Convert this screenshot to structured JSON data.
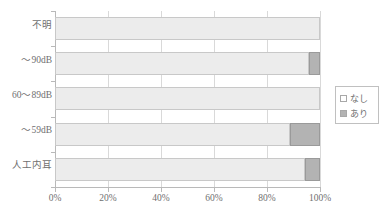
{
  "chart_data": {
    "type": "bar",
    "orientation": "horizontal",
    "stacked": true,
    "stack_mode": "percent",
    "title": "",
    "xlabel": "",
    "ylabel": "",
    "xlim": [
      0,
      100
    ],
    "xticks": [
      0,
      20,
      40,
      60,
      80,
      100
    ],
    "xtick_labels": [
      "0%",
      "20%",
      "40%",
      "60%",
      "80%",
      "100%"
    ],
    "grid": true,
    "grid_axis": "x",
    "legend_position": "right",
    "categories": [
      "人工内耳",
      "～59dB",
      "60～89dB",
      "～90dB",
      "不明"
    ],
    "categories_top_to_bottom": [
      "不明",
      "～90dB",
      "60～89dB",
      "～59dB",
      "人工内耳"
    ],
    "series": [
      {
        "name": "なし",
        "color": "#ececec",
        "values_top_to_bottom": [
          100,
          95.8,
          100,
          88.7,
          94.3
        ]
      },
      {
        "name": "あり",
        "color": "#b3b3b3",
        "values_top_to_bottom": [
          0,
          4.2,
          0,
          11.3,
          5.7
        ]
      }
    ]
  },
  "legend": {
    "items": [
      {
        "label": "なし",
        "swatch": "white-square-swatch"
      },
      {
        "label": "あり",
        "swatch": "gray-square-swatch"
      }
    ]
  },
  "axes": {
    "y_labels": [
      "不明",
      "～90dB",
      "60～89dB",
      "～59dB",
      "人工内耳"
    ],
    "x_labels": [
      "0%",
      "20%",
      "40%",
      "60%",
      "80%",
      "100%"
    ]
  },
  "colors": {
    "series_none": "#ececec",
    "series_yes": "#b3b3b3",
    "axis": "#b9b9b9",
    "grid": "#d9d9d9",
    "text": "#6f6f6f",
    "border": "#c8c8c8"
  }
}
